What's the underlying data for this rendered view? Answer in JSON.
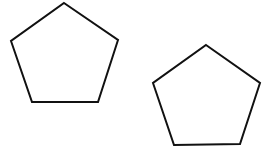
{
  "diagram": {
    "background": "#ffffff",
    "stroke_color": "#111111",
    "stroke_width": 2,
    "shapes": [
      {
        "type": "pentagon",
        "points": "64,3 118,40 98,102 32,102 11,41"
      },
      {
        "type": "pentagon",
        "points": "206,45 260,83 240,144 174,145 153,83"
      }
    ]
  }
}
